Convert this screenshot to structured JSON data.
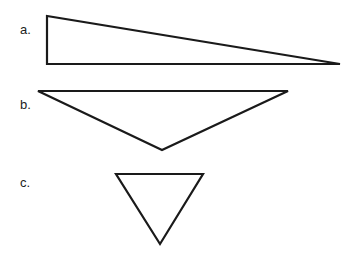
{
  "figures": [
    {
      "label": "a.",
      "shape": "right triangle",
      "points": [
        [
          47,
          16
        ],
        [
          47,
          64
        ],
        [
          340,
          64
        ]
      ],
      "label_pos": [
        20,
        34
      ]
    },
    {
      "label": "b.",
      "shape": "obtuse triangle",
      "points": [
        [
          38,
          91
        ],
        [
          288,
          91
        ],
        [
          162,
          150
        ]
      ],
      "label_pos": [
        20,
        109
      ]
    },
    {
      "label": "c.",
      "shape": "equilateral triangle",
      "points": [
        [
          116,
          174
        ],
        [
          203,
          174
        ],
        [
          160,
          244
        ]
      ],
      "label_pos": [
        20,
        187
      ]
    }
  ],
  "colors": {
    "stroke": "#1a1a1a",
    "background": "#ffffff"
  }
}
